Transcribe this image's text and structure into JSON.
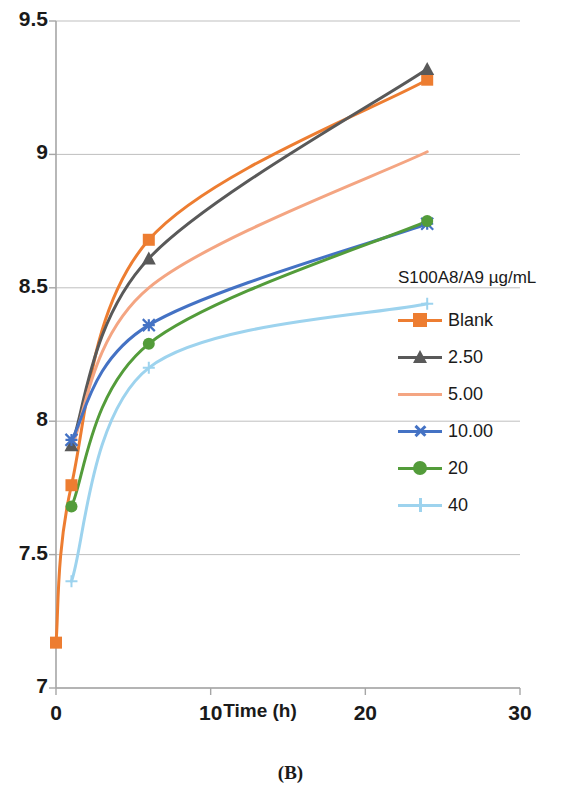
{
  "chart_data": {
    "type": "line",
    "title": "",
    "xlabel": "Time (h)",
    "ylabel": "",
    "xlim": [
      0,
      30
    ],
    "ylim": [
      7,
      9.5
    ],
    "xticks": [
      0,
      10,
      20,
      30
    ],
    "yticks": [
      7,
      7.5,
      8,
      8.5,
      9,
      9.5
    ],
    "xtick_labels": [
      "0",
      "10",
      "20",
      "30"
    ],
    "ytick_labels": [
      "7",
      "7.5",
      "8",
      "8.5",
      "9",
      "9.5"
    ],
    "grid": "horizontal",
    "legend_position": "right",
    "legend_title": "S100A8/A9 µg/mL",
    "x": [
      0,
      1,
      6,
      24
    ],
    "series": [
      {
        "name": "Blank",
        "color": "#ED7D31",
        "marker": "square",
        "x": [
          0,
          1,
          6,
          24
        ],
        "values": [
          7.17,
          7.76,
          8.68,
          9.28
        ]
      },
      {
        "name": "2.50",
        "color": "#595959",
        "marker": "triangle",
        "x": [
          1,
          6,
          24
        ],
        "values": [
          7.91,
          8.61,
          9.32
        ]
      },
      {
        "name": "5.00",
        "color": "#F4A582",
        "marker": "none",
        "x": [
          1,
          6,
          24
        ],
        "values": [
          7.9,
          8.5,
          9.01
        ]
      },
      {
        "name": "10.00",
        "color": "#4472C4",
        "marker": "x",
        "x": [
          1,
          6,
          24
        ],
        "values": [
          7.93,
          8.36,
          8.74
        ]
      },
      {
        "name": "20",
        "color": "#539C3A",
        "marker": "circle",
        "x": [
          1,
          6,
          24
        ],
        "values": [
          7.68,
          8.29,
          8.75
        ]
      },
      {
        "name": "40",
        "color": "#9DD3EE",
        "marker": "plus",
        "x": [
          1,
          6,
          24
        ],
        "values": [
          7.4,
          8.2,
          8.44
        ]
      }
    ]
  },
  "axis": {
    "x_title": "Time (h)",
    "x_ticks": [
      "0",
      "10",
      "20",
      "30"
    ],
    "y_ticks": [
      "7",
      "7.5",
      "8",
      "8.5",
      "9",
      "9.5"
    ]
  },
  "legend": {
    "title": "S100A8/A9 µg/mL",
    "items": [
      {
        "label": "Blank",
        "color": "#ED7D31",
        "marker": "square"
      },
      {
        "label": "2.50",
        "color": "#595959",
        "marker": "triangle"
      },
      {
        "label": "5.00",
        "color": "#F4A582",
        "marker": "none"
      },
      {
        "label": "10.00",
        "color": "#4472C4",
        "marker": "x"
      },
      {
        "label": "20",
        "color": "#539C3A",
        "marker": "circle"
      },
      {
        "label": "40",
        "color": "#9DD3EE",
        "marker": "plus"
      }
    ]
  },
  "caption": {
    "panel": "(B)",
    "panel_letter": "B"
  },
  "colors": {
    "axis": "#A6A6A6",
    "grid": "#BFBFBF",
    "text": "#1a1a1a",
    "background": "#FFFFFF"
  }
}
